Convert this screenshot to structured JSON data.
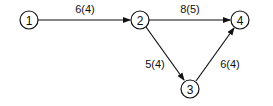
{
  "diagram": {
    "type": "directed-network",
    "nodes": [
      {
        "id": "1",
        "label": "1",
        "x": 29,
        "y": 20
      },
      {
        "id": "2",
        "label": "2",
        "x": 140,
        "y": 20
      },
      {
        "id": "3",
        "label": "3",
        "x": 190,
        "y": 89
      },
      {
        "id": "4",
        "label": "4",
        "x": 240,
        "y": 20
      }
    ],
    "edges": [
      {
        "from": "1",
        "to": "2",
        "label": "6(4)"
      },
      {
        "from": "2",
        "to": "4",
        "label": "8(5)"
      },
      {
        "from": "2",
        "to": "3",
        "label": "5(4)"
      },
      {
        "from": "3",
        "to": "4",
        "label": "6(4)"
      }
    ],
    "colors": {
      "stroke": "#111111",
      "background": "#ffffff"
    }
  }
}
